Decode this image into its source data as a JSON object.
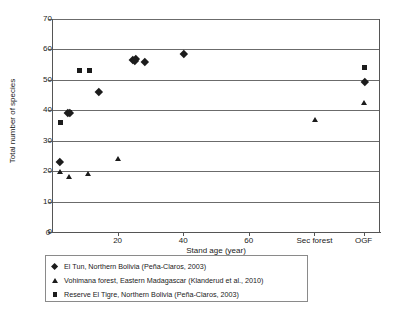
{
  "chart_data": {
    "type": "scatter",
    "title": "",
    "xlabel": "Stand age (year)",
    "ylabel": "Total number of species",
    "ylim": [
      0,
      70
    ],
    "ytick_labels": [
      "0",
      "10",
      "20",
      "30",
      "40",
      "50",
      "60",
      "70"
    ],
    "ytick_values": [
      0,
      10,
      20,
      30,
      40,
      50,
      60,
      70
    ],
    "xtick_labels": [
      "20",
      "40",
      "60",
      "Sec forest",
      "OGF"
    ],
    "xtick_values": [
      20,
      40,
      60,
      80,
      95
    ],
    "xlim": [
      0,
      100
    ],
    "grid": "horizontal",
    "legend_position": "below-plot",
    "series": [
      {
        "name": "El Tun, Northern Bolivia (Peña-Claros, 2003)",
        "marker": "diamond",
        "color": "#1c1c1c",
        "points": [
          {
            "x": 2.0,
            "y": 23.2
          },
          {
            "x": 4.6,
            "y": 39.2
          },
          {
            "x": 5.2,
            "y": 39.2
          },
          {
            "x": 14.0,
            "y": 46.0
          },
          {
            "x": 24.3,
            "y": 56.6
          },
          {
            "x": 25.2,
            "y": 57.0
          },
          {
            "x": 25.0,
            "y": 56.2
          },
          {
            "x": 28.0,
            "y": 56.0
          },
          {
            "x": 40.0,
            "y": 58.7
          },
          {
            "x": 95.0,
            "y": 49.3
          }
        ]
      },
      {
        "name": "Vohimana forest, Eastern Madagascar (Klanderud et al., 2010)",
        "marker": "triangle",
        "color": "#1c1c1c",
        "points": [
          {
            "x": 2.1,
            "y": 19.8
          },
          {
            "x": 4.8,
            "y": 18.1
          },
          {
            "x": 10.8,
            "y": 19.0
          },
          {
            "x": 20.0,
            "y": 24.0
          },
          {
            "x": 80.0,
            "y": 37.0
          },
          {
            "x": 95.0,
            "y": 42.5
          }
        ]
      },
      {
        "name": "Reserve El Tigre, Northern Bolivia (Peña-Claros, 2003)",
        "marker": "square",
        "color": "#1c1c1c",
        "points": [
          {
            "x": 2.2,
            "y": 36.0
          },
          {
            "x": 5.0,
            "y": 39.3
          },
          {
            "x": 8.2,
            "y": 53.0
          },
          {
            "x": 11.0,
            "y": 53.0
          },
          {
            "x": 95.0,
            "y": 54.0
          }
        ]
      }
    ]
  },
  "axes": {
    "x_title": "Stand age (year)",
    "y_title": "Total number of species"
  },
  "legend": {
    "items": [
      {
        "marker": "diamond",
        "label": "El Tun, Northern Bolivia (Peña-Claros, 2003)"
      },
      {
        "marker": "triangle",
        "label": "Vohimana forest, Eastern Madagascar (Klanderud et al., 2010)"
      },
      {
        "marker": "square",
        "label": "Reserve El Tigre, Northern Bolivia (Peña-Claros, 2003)"
      }
    ]
  }
}
